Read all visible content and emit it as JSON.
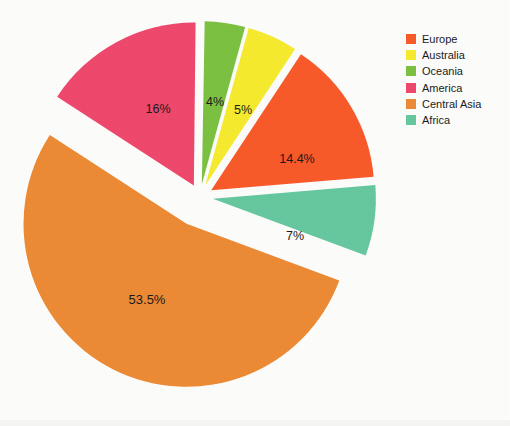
{
  "chart_data": {
    "type": "pie",
    "title": "",
    "categories": [
      "Europe",
      "Australia",
      "Oceania",
      "America",
      "Central Asia",
      "Africa"
    ],
    "values": [
      14.4,
      5,
      4,
      16,
      53.5,
      7
    ],
    "value_unit": "%",
    "data_labels": [
      "14.4%",
      "5%",
      "4%",
      "16%",
      "53.5%",
      "7%"
    ],
    "colors": [
      "#fa5a2a",
      "#f7ec2e",
      "#7dc242",
      "#f0496e",
      "#ee8b35",
      "#67c9a0"
    ],
    "exploded": true,
    "legend_position": "right",
    "grid": false,
    "slices": [
      {
        "name": "Oceania",
        "value": 4,
        "label": "4%",
        "color": "#7dc242",
        "start_deg": 1.0,
        "end_deg": 15.4,
        "offset": 13,
        "label_x": 215,
        "label_y": 103
      },
      {
        "name": "Australia",
        "value": 5,
        "label": "5%",
        "color": "#f7ec2e",
        "start_deg": 15.4,
        "end_deg": 33.4,
        "offset": 13,
        "label_x": 243,
        "label_y": 111
      },
      {
        "name": "Europe",
        "value": 14.4,
        "label": "14.4%",
        "color": "#fa5a2a",
        "start_deg": 33.4,
        "end_deg": 85.2,
        "offset": 13,
        "label_x": 297,
        "label_y": 160
      },
      {
        "name": "Africa",
        "value": 7,
        "label": "7%",
        "color": "#67c9a0",
        "start_deg": 85.2,
        "end_deg": 110.4,
        "offset": 13,
        "label_x": 295,
        "label_y": 237
      },
      {
        "name": "Central Asia",
        "value": 53.5,
        "label": "53.5%",
        "color": "#ee8b35",
        "start_deg": 110.4,
        "end_deg": 303.0,
        "offset": 30,
        "label_x": 147,
        "label_y": 301
      },
      {
        "name": "America",
        "value": 16,
        "label": "16%",
        "color": "#f0496e",
        "start_deg": 303.0,
        "end_deg": 360.6,
        "offset": 13,
        "label_x": 158,
        "label_y": 110
      }
    ],
    "geometry": {
      "cx": 200,
      "cy": 197,
      "r": 163
    }
  },
  "legend": {
    "items": [
      {
        "label": "Europe",
        "color": "#fa5a2a"
      },
      {
        "label": "Australia",
        "color": "#f7ec2e"
      },
      {
        "label": "Oceania",
        "color": "#7dc242"
      },
      {
        "label": "America",
        "color": "#f0496e"
      },
      {
        "label": "Central Asia",
        "color": "#ee8b35"
      },
      {
        "label": "Africa",
        "color": "#67c9a0"
      }
    ]
  }
}
